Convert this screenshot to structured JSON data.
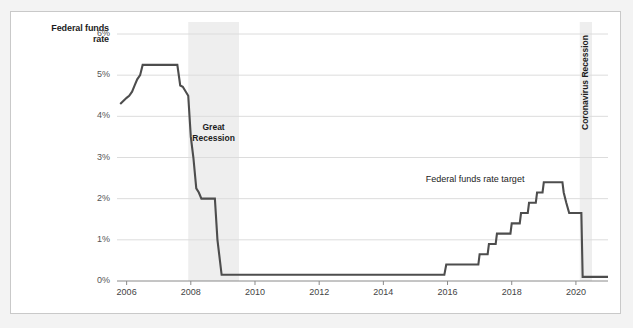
{
  "chart_data": {
    "type": "line",
    "title": "",
    "xlabel": "",
    "ylabel": "Federal funds rate",
    "xlim": [
      2005.7,
      2021.0
    ],
    "ylim": [
      0,
      6
    ],
    "grid": true,
    "legend_position": "inline-annotation",
    "y_ticks": [
      "0%",
      "1%",
      "2%",
      "3%",
      "4%",
      "5%",
      "6%"
    ],
    "y_tick_values": [
      0,
      1,
      2,
      3,
      4,
      5,
      6
    ],
    "x_ticks": [
      "2006",
      "2008",
      "2010",
      "2012",
      "2014",
      "2016",
      "2018",
      "2020"
    ],
    "x_tick_values": [
      2006,
      2008,
      2010,
      2012,
      2014,
      2016,
      2018,
      2020
    ],
    "series": [
      {
        "name": "Federal funds rate target",
        "color": "#4d4d4d",
        "points": [
          [
            2005.8,
            4.3
          ],
          [
            2006.0,
            4.45
          ],
          [
            2006.08,
            4.5
          ],
          [
            2006.17,
            4.6
          ],
          [
            2006.25,
            4.75
          ],
          [
            2006.33,
            4.9
          ],
          [
            2006.42,
            5.0
          ],
          [
            2006.5,
            5.25
          ],
          [
            2007.58,
            5.25
          ],
          [
            2007.67,
            4.75
          ],
          [
            2007.75,
            4.72
          ],
          [
            2007.92,
            4.5
          ],
          [
            2008.0,
            3.5
          ],
          [
            2008.08,
            3.0
          ],
          [
            2008.17,
            2.25
          ],
          [
            2008.25,
            2.15
          ],
          [
            2008.33,
            2.0
          ],
          [
            2008.75,
            2.0
          ],
          [
            2008.83,
            1.0
          ],
          [
            2008.96,
            0.15
          ],
          [
            2015.9,
            0.15
          ],
          [
            2015.96,
            0.4
          ],
          [
            2016.96,
            0.4
          ],
          [
            2017.0,
            0.65
          ],
          [
            2017.25,
            0.65
          ],
          [
            2017.29,
            0.9
          ],
          [
            2017.5,
            0.9
          ],
          [
            2017.54,
            1.15
          ],
          [
            2017.96,
            1.15
          ],
          [
            2018.0,
            1.4
          ],
          [
            2018.25,
            1.4
          ],
          [
            2018.29,
            1.65
          ],
          [
            2018.5,
            1.65
          ],
          [
            2018.54,
            1.9
          ],
          [
            2018.75,
            1.9
          ],
          [
            2018.79,
            2.15
          ],
          [
            2018.96,
            2.15
          ],
          [
            2019.0,
            2.4
          ],
          [
            2019.58,
            2.4
          ],
          [
            2019.62,
            2.15
          ],
          [
            2019.7,
            1.9
          ],
          [
            2019.79,
            1.65
          ],
          [
            2020.17,
            1.65
          ],
          [
            2020.21,
            0.1
          ],
          [
            2021.0,
            0.1
          ]
        ]
      }
    ],
    "shaded_regions": [
      {
        "label": "Great Recession",
        "start": 2007.92,
        "end": 2009.5,
        "color": "#eeeeee",
        "label_orientation": "horizontal"
      },
      {
        "label": "Coronavirus Recession",
        "start": 2020.12,
        "end": 2020.5,
        "color": "#eeeeee",
        "label_orientation": "vertical"
      }
    ],
    "annotations": [
      {
        "text": "Federal funds rate target",
        "x": 2017.1,
        "y": 2.45
      }
    ]
  },
  "axis": {
    "y_axis_title_line1": "Federal funds",
    "y_axis_title_line2": "rate"
  },
  "colors": {
    "line": "#4d4d4d",
    "grid": "#dcdcdc",
    "band": "#eeeeee",
    "frame": "#c9c9c9",
    "page_background": "#f3f3f3",
    "plot_background": "#ffffff",
    "tick_text": "#555555",
    "label_text": "#1c1c1c"
  }
}
